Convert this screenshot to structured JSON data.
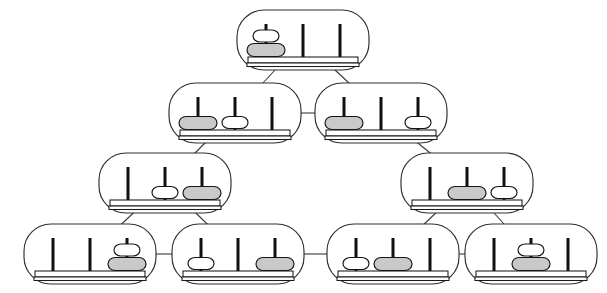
{
  "diagram": {
    "type": "state-graph",
    "background_color": "#ffffff",
    "node_border_color": "#2e2e2e",
    "edge_color": "#3a3a3a",
    "peg_color": "#111111",
    "disk_large_color": "#c9c9c9",
    "disk_small_color": "#ffffff",
    "peg_count": 3,
    "disk_count": 2,
    "disk_names": [
      "large",
      "small"
    ],
    "node_width": 132,
    "node_height": 60,
    "node_corner_radius": 27
  },
  "nodes": [
    {
      "id": "n0",
      "name": "top-state",
      "row": 0,
      "cx": 303,
      "cy": 40,
      "pegs": [
        [
          "large",
          "small"
        ],
        [],
        []
      ],
      "label": "both disks on peg 1"
    },
    {
      "id": "n1",
      "name": "row2-left-state",
      "row": 1,
      "cx": 235,
      "cy": 113,
      "pegs": [
        [
          "large"
        ],
        [
          "small"
        ],
        []
      ],
      "label": "large on peg 1, small on peg 2"
    },
    {
      "id": "n2",
      "name": "row2-right-state",
      "row": 1,
      "cx": 381,
      "cy": 113,
      "pegs": [
        [
          "large"
        ],
        [],
        [
          "small"
        ]
      ],
      "label": "large on peg 1, small on peg 3"
    },
    {
      "id": "n3",
      "name": "row3-left-state",
      "row": 2,
      "cx": 165,
      "cy": 183,
      "pegs": [
        [],
        [
          "small"
        ],
        [
          "large"
        ]
      ],
      "label": "small on peg 2, large on peg 3"
    },
    {
      "id": "n4",
      "name": "row3-right-state",
      "row": 2,
      "cx": 467,
      "cy": 183,
      "pegs": [
        [],
        [
          "large"
        ],
        [
          "small"
        ]
      ],
      "label": "large on peg 2, small on peg 3"
    },
    {
      "id": "n5",
      "name": "bottom-state-1",
      "row": 3,
      "cx": 90,
      "cy": 254,
      "pegs": [
        [],
        [],
        [
          "large",
          "small"
        ]
      ],
      "label": "both disks on peg 3"
    },
    {
      "id": "n6",
      "name": "bottom-state-2",
      "row": 3,
      "cx": 238,
      "cy": 254,
      "pegs": [
        [
          "small"
        ],
        [],
        [
          "large"
        ]
      ],
      "label": "small on peg 1, large on peg 3"
    },
    {
      "id": "n7",
      "name": "bottom-state-3",
      "row": 3,
      "cx": 393,
      "cy": 254,
      "pegs": [
        [
          "small"
        ],
        [
          "large"
        ],
        []
      ],
      "label": "small on peg 1, large on peg 2"
    },
    {
      "id": "n8",
      "name": "bottom-state-4",
      "row": 3,
      "cx": 531,
      "cy": 254,
      "pegs": [
        [],
        [
          "large",
          "small"
        ],
        []
      ],
      "label": "both disks on peg 2"
    }
  ],
  "edges": [
    {
      "name": "edge-top-to-row2-left",
      "from": "n0",
      "to": "n1"
    },
    {
      "name": "edge-top-to-row2-right",
      "from": "n0",
      "to": "n2"
    },
    {
      "name": "edge-row2-left-right",
      "from": "n1",
      "to": "n2"
    },
    {
      "name": "edge-row2-left-to-row3",
      "from": "n1",
      "to": "n3"
    },
    {
      "name": "edge-row2-right-to-row3",
      "from": "n2",
      "to": "n4"
    },
    {
      "name": "edge-row3-left-to-b1",
      "from": "n3",
      "to": "n5"
    },
    {
      "name": "edge-row3-left-to-b2",
      "from": "n3",
      "to": "n6"
    },
    {
      "name": "edge-row3-right-to-b3",
      "from": "n4",
      "to": "n7"
    },
    {
      "name": "edge-row3-right-to-b4",
      "from": "n4",
      "to": "n8"
    },
    {
      "name": "edge-b1-b2",
      "from": "n5",
      "to": "n6"
    },
    {
      "name": "edge-b2-b3",
      "from": "n6",
      "to": "n7"
    },
    {
      "name": "edge-b3-b4",
      "from": "n7",
      "to": "n8"
    }
  ]
}
